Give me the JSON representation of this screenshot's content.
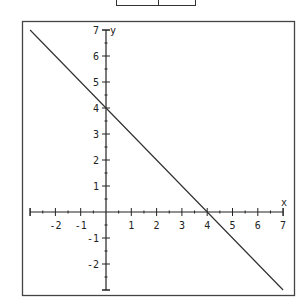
{
  "colors": {
    "line": "#333333",
    "axis": "#222222",
    "border": "#444444",
    "background": "#ffffff"
  },
  "chart_data": {
    "type": "line",
    "title": "",
    "xlabel": "x",
    "ylabel": "y",
    "xlim": [
      -3,
      7
    ],
    "ylim": [
      -3,
      7
    ],
    "grid": false,
    "legend": null,
    "x_ticks": [
      -2,
      -1,
      1,
      2,
      3,
      4,
      5,
      6,
      7
    ],
    "y_ticks": [
      7,
      6,
      5,
      4,
      3,
      2,
      1,
      -1,
      -2
    ],
    "series": [
      {
        "name": "y = 4 - x",
        "x": [
          -3,
          0,
          4,
          7
        ],
        "y": [
          7,
          4,
          0,
          -3
        ]
      }
    ],
    "annotations": []
  },
  "labels": {
    "x_axis": "x",
    "y_axis": "y",
    "xt": [
      "-2",
      "-1",
      "1",
      "2",
      "3",
      "4",
      "5",
      "6",
      "7"
    ],
    "yt": [
      "7",
      "6",
      "5",
      "4",
      "3",
      "2",
      "1",
      "-1",
      "-2"
    ]
  }
}
